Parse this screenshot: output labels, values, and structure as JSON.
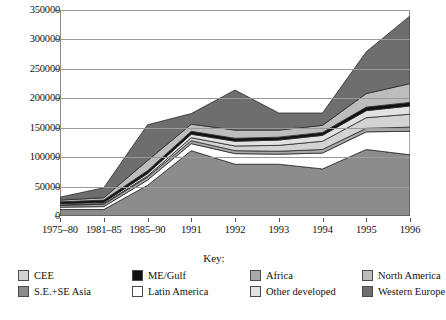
{
  "chart_data": {
    "type": "area",
    "stacked": true,
    "title": "",
    "xlabel": "",
    "ylabel": "",
    "x": [
      "1975–80",
      "1981–85",
      "1985–90",
      "1991",
      "1992",
      "1993",
      "1994",
      "1995",
      "1996"
    ],
    "ylim": [
      0,
      350000
    ],
    "ytick_values": [
      0,
      50000,
      100000,
      150000,
      200000,
      250000,
      300000,
      350000
    ],
    "ytick_labels": [
      "0",
      "50000",
      "100000",
      "150000",
      "200000",
      "250000",
      "300000",
      "350000"
    ],
    "grid": true,
    "legend_position": "bottom",
    "legend_title": "Key:",
    "series": [
      {
        "name": "S.E.+SE Asia",
        "color": "#8c8c8c",
        "values": [
          11000,
          11000,
          52000,
          111000,
          88000,
          88000,
          80000,
          113000,
          104000
        ]
      },
      {
        "name": "Latin America",
        "color": "#ffffff",
        "values": [
          4000,
          5000,
          9000,
          12000,
          18000,
          17000,
          27000,
          30000,
          40000
        ]
      },
      {
        "name": "Africa",
        "color": "#a8a8a8",
        "values": [
          3000,
          4000,
          5000,
          5000,
          5000,
          5000,
          6000,
          6000,
          7000
        ]
      },
      {
        "name": "CEE",
        "color": "#d3d3d3",
        "values": [
          1000,
          1000,
          2000,
          5000,
          8000,
          10000,
          14000,
          18000,
          22000
        ]
      },
      {
        "name": "Other developed",
        "color": "#e2e2e2",
        "values": [
          2000,
          2000,
          4000,
          6000,
          8000,
          9000,
          10000,
          12000,
          14000
        ]
      },
      {
        "name": "ME/Gulf",
        "color": "#111111",
        "values": [
          3000,
          4000,
          5000,
          5000,
          5000,
          5000,
          5000,
          6000,
          6000
        ]
      },
      {
        "name": "North America",
        "color": "#bdbdbd",
        "values": [
          3000,
          4000,
          17000,
          12000,
          14000,
          12000,
          12000,
          23000,
          32000
        ]
      },
      {
        "name": "Western Europe",
        "color": "#6e6e6e",
        "values": [
          5000,
          17000,
          61000,
          18000,
          68000,
          29000,
          21000,
          71000,
          115000
        ]
      }
    ],
    "totals": [
      32000,
      48000,
      155000,
      174000,
      214000,
      175000,
      175000,
      279000,
      340000
    ]
  },
  "legend": {
    "title": "Key:",
    "items": [
      {
        "label": "CEE",
        "color": "#d3d3d3"
      },
      {
        "label": "ME/Gulf",
        "color": "#111111"
      },
      {
        "label": "Africa",
        "color": "#a8a8a8"
      },
      {
        "label": "North America",
        "color": "#bdbdbd"
      },
      {
        "label": "S.E.+SE Asia",
        "color": "#8c8c8c"
      },
      {
        "label": "Latin America",
        "color": "#ffffff"
      },
      {
        "label": "Other developed",
        "color": "#e2e2e2"
      },
      {
        "label": "Western Europe",
        "color": "#6e6e6e"
      }
    ]
  }
}
